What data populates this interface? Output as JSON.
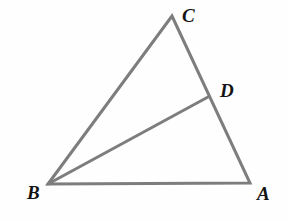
{
  "figure": {
    "kind": "geometry-diagram",
    "background_color": "#fefefe",
    "stroke_color": "#7d7d7d",
    "stroke_width": 3,
    "label_color": "#141414",
    "width": 288,
    "height": 221
  },
  "points": {
    "A": {
      "label": "A",
      "x": 250,
      "y": 183
    },
    "B": {
      "label": "B",
      "x": 48,
      "y": 184
    },
    "C": {
      "label": "C",
      "x": 172,
      "y": 16
    },
    "D": {
      "label": "D",
      "x": 208,
      "y": 97
    }
  },
  "segments": [
    {
      "name": "BC",
      "from": "B",
      "to": "C"
    },
    {
      "name": "CA",
      "from": "C",
      "to": "A"
    },
    {
      "name": "BA",
      "from": "B",
      "to": "A"
    },
    {
      "name": "BD",
      "from": "B",
      "to": "D"
    }
  ],
  "paths": {
    "triangle": "M 48 184 L 172 16 L 250 183 Z",
    "cevian": "M 48 184 L 208 97"
  }
}
